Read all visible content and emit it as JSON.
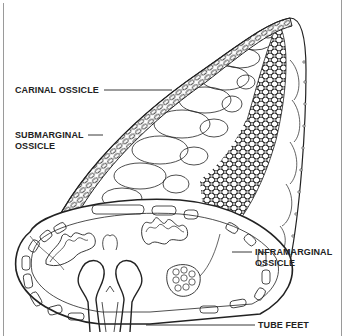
{
  "figure": {
    "colors": {
      "ink": "#222222",
      "paper": "#ffffff",
      "frame": "#9a9a9a"
    }
  },
  "labels": {
    "carinal": {
      "line1": "CARINAL OSSICLE"
    },
    "submarginal": {
      "line1": "SUBMARGINAL",
      "line2": "OSSICLE"
    },
    "inframarginal": {
      "line1": "INFRAMARGINAL",
      "line2": "OSSICLE"
    },
    "tube_feet": {
      "line1": "TUBE FEET"
    }
  }
}
